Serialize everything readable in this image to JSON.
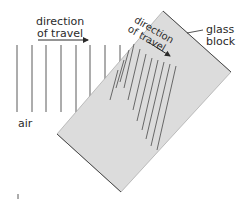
{
  "diagram": {
    "labels": {
      "air_direction_line1": "direction",
      "air_direction_line2": "of travel",
      "glass_direction_line1": "direction",
      "glass_direction_line2": "of travel",
      "glass_block_line1": "glass",
      "glass_block_line2": "block",
      "air": "air"
    },
    "colors": {
      "block_fill": "#dcdcdc",
      "block_edge": "#4a4a4a",
      "wavefront": "#5a5a5a",
      "text": "#2a2a2a"
    },
    "air_wavefront_count": 8,
    "glass_wavefront_count": 11
  }
}
